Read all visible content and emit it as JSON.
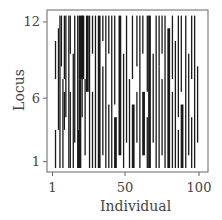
{
  "chart_data": {
    "type": "heatmap",
    "title": "",
    "xlabel": "Individual",
    "ylabel": "Locus",
    "x_ticks": [
      1,
      50,
      100
    ],
    "y_ticks": [
      1,
      6,
      12
    ],
    "xlim": [
      1,
      100
    ],
    "ylim": [
      1,
      12
    ],
    "colors": {
      "on": "#1a1a1a",
      "off": "#ffffff",
      "frame": "#555555"
    },
    "n_individuals": 100,
    "n_loci": 12,
    "segments": [
      [
        3,
        3,
        1,
        3
      ],
      [
        3,
        3,
        8,
        10
      ],
      [
        5,
        5,
        4,
        11
      ],
      [
        6,
        6,
        1,
        12
      ],
      [
        7,
        7,
        9,
        12
      ],
      [
        8,
        8,
        1,
        7
      ],
      [
        9,
        9,
        4,
        6
      ],
      [
        9,
        9,
        8,
        12
      ],
      [
        10,
        10,
        5,
        12
      ],
      [
        12,
        12,
        1,
        12
      ],
      [
        13,
        13,
        1,
        6
      ],
      [
        13,
        13,
        10,
        12
      ],
      [
        15,
        15,
        1,
        9
      ],
      [
        16,
        16,
        3,
        12
      ],
      [
        18,
        20,
        1,
        3
      ],
      [
        18,
        18,
        4,
        12
      ],
      [
        19,
        20,
        4,
        7
      ],
      [
        19,
        22,
        8,
        12
      ],
      [
        21,
        21,
        5,
        12
      ],
      [
        23,
        23,
        2,
        7
      ],
      [
        24,
        25,
        7,
        12
      ],
      [
        26,
        26,
        1,
        12
      ],
      [
        28,
        28,
        1,
        6
      ],
      [
        28,
        28,
        10,
        12
      ],
      [
        30,
        30,
        1,
        12
      ],
      [
        32,
        33,
        1,
        12
      ],
      [
        35,
        35,
        2,
        8
      ],
      [
        35,
        35,
        11,
        12
      ],
      [
        37,
        37,
        1,
        12
      ],
      [
        39,
        39,
        1,
        5
      ],
      [
        39,
        39,
        10,
        12
      ],
      [
        41,
        41,
        1,
        12
      ],
      [
        43,
        44,
        1,
        4
      ],
      [
        43,
        43,
        6,
        12
      ],
      [
        46,
        47,
        2,
        12
      ],
      [
        49,
        49,
        1,
        9
      ],
      [
        51,
        51,
        3,
        12
      ],
      [
        53,
        53,
        1,
        7
      ],
      [
        55,
        56,
        1,
        5
      ],
      [
        55,
        55,
        8,
        12
      ],
      [
        58,
        58,
        3,
        6
      ],
      [
        58,
        58,
        9,
        12
      ],
      [
        60,
        60,
        1,
        12
      ],
      [
        62,
        63,
        2,
        6
      ],
      [
        62,
        62,
        10,
        12
      ],
      [
        65,
        65,
        1,
        4
      ],
      [
        65,
        65,
        7,
        12
      ],
      [
        66,
        67,
        1,
        12
      ],
      [
        69,
        69,
        3,
        9
      ],
      [
        71,
        71,
        1,
        12
      ],
      [
        73,
        73,
        1,
        8
      ],
      [
        73,
        73,
        9,
        12
      ],
      [
        75,
        75,
        2,
        7
      ],
      [
        75,
        75,
        10,
        12
      ],
      [
        77,
        77,
        1,
        12
      ],
      [
        79,
        80,
        1,
        11
      ],
      [
        82,
        82,
        1,
        6
      ],
      [
        82,
        82,
        8,
        12
      ],
      [
        84,
        84,
        1,
        10
      ],
      [
        86,
        86,
        1,
        3
      ],
      [
        86,
        86,
        5,
        12
      ],
      [
        88,
        89,
        1,
        5
      ],
      [
        88,
        88,
        7,
        12
      ],
      [
        91,
        91,
        1,
        12
      ],
      [
        93,
        93,
        2,
        9
      ],
      [
        95,
        95,
        1,
        4
      ],
      [
        95,
        95,
        8,
        12
      ],
      [
        97,
        97,
        1,
        12
      ],
      [
        99,
        99,
        3,
        8
      ]
    ]
  }
}
